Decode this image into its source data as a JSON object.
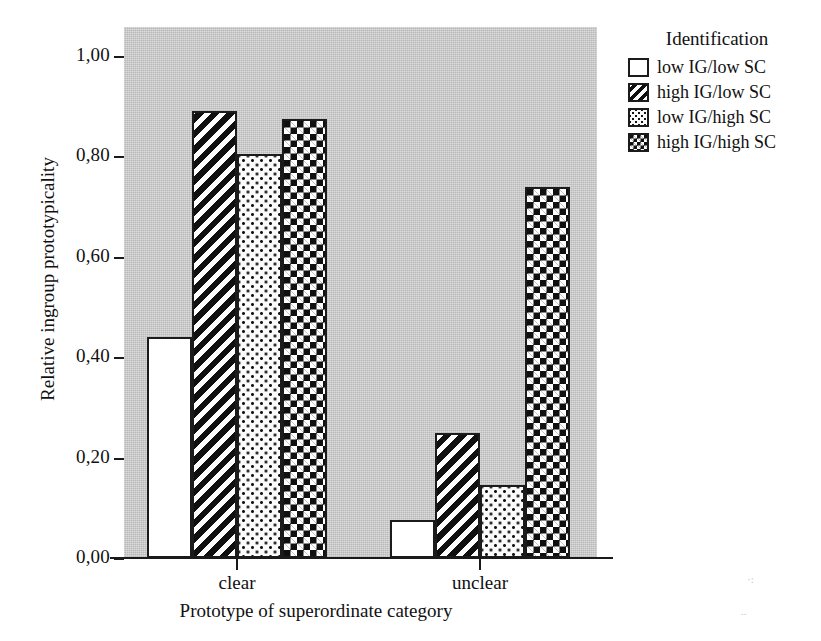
{
  "chart_data": {
    "type": "bar",
    "title": "",
    "xlabel": "Prototype of superordinate category",
    "ylabel": "Relative ingroup prototypicality",
    "categories": [
      "clear",
      "unclear"
    ],
    "ylim": [
      0.0,
      1.0
    ],
    "ytick_labels": [
      "0,00",
      "0,20",
      "0,40",
      "0,60",
      "0,80",
      "1,00"
    ],
    "ytick_values": [
      0.0,
      0.2,
      0.4,
      0.6,
      0.8,
      1.0
    ],
    "grid": false,
    "legend_position": "right",
    "legend_title": "Identification",
    "series": [
      {
        "name": "low IG/low SC",
        "pattern": "solid-white",
        "values": [
          0.44,
          0.075
        ]
      },
      {
        "name": "high IG/low SC",
        "pattern": "diagonal-hatch",
        "values": [
          0.89,
          0.25
        ]
      },
      {
        "name": "low IG/high SC",
        "pattern": "fine-dots",
        "values": [
          0.805,
          0.145
        ]
      },
      {
        "name": "high IG/high SC",
        "pattern": "checkerboard",
        "values": [
          0.875,
          0.74
        ]
      }
    ]
  },
  "colors": {
    "panel_background": "#c9c9c9",
    "figure_background": "#ffffff",
    "ink": "#1b1b1b",
    "bar_light": "#ffffff",
    "bar_dark": "#101010"
  },
  "legend": {
    "title": "Identification",
    "entries": [
      {
        "label": "low IG/low SC"
      },
      {
        "label": "high IG/low SC"
      },
      {
        "label": "low IG/high SC"
      },
      {
        "label": "high IG/high SC"
      }
    ]
  },
  "axes": {
    "y_title": "Relative ingroup prototypicality",
    "x_title": "Prototype of superordinate category",
    "y_ticks": [
      {
        "label": "1,00"
      },
      {
        "label": "0,80"
      },
      {
        "label": "0,60"
      },
      {
        "label": "0,40"
      },
      {
        "label": "0,20"
      },
      {
        "label": "0,00"
      }
    ],
    "x_ticks": [
      {
        "label": "clear"
      },
      {
        "label": "unclear"
      }
    ]
  }
}
